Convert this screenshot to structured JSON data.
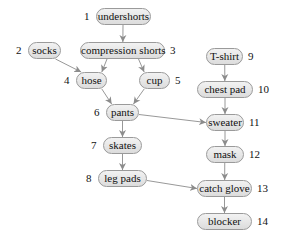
{
  "diagram": {
    "type": "dependency-graph",
    "title": "",
    "colors": {
      "node_fill": "#e6e6e6",
      "node_border": "#9a9a9a",
      "edge": "#8c8c8c",
      "text": "#111111"
    },
    "nodes": [
      {
        "id": 1,
        "num": "1",
        "label": "undershorts",
        "x": 96,
        "y": 8,
        "w": 55,
        "numSide": "left"
      },
      {
        "id": 2,
        "num": "2",
        "label": "socks",
        "x": 28,
        "y": 42,
        "w": 33,
        "numSide": "left"
      },
      {
        "id": 3,
        "num": "3",
        "label": "compression shorts",
        "x": 80,
        "y": 42,
        "w": 85,
        "numSide": "right"
      },
      {
        "id": 4,
        "num": "4",
        "label": "hose",
        "x": 76,
        "y": 72,
        "w": 31,
        "numSide": "left"
      },
      {
        "id": 5,
        "num": "5",
        "label": "cup",
        "x": 139,
        "y": 72,
        "w": 31,
        "numSide": "right"
      },
      {
        "id": 6,
        "num": "6",
        "label": "pants",
        "x": 106,
        "y": 104,
        "w": 33,
        "numSide": "left"
      },
      {
        "id": 7,
        "num": "7",
        "label": "skates",
        "x": 103,
        "y": 137,
        "w": 39,
        "numSide": "left"
      },
      {
        "id": 8,
        "num": "8",
        "label": "leg pads",
        "x": 98,
        "y": 170,
        "w": 49,
        "numSide": "left"
      },
      {
        "id": 9,
        "num": "9",
        "label": "T-shirt",
        "x": 206,
        "y": 48,
        "w": 37,
        "numSide": "right"
      },
      {
        "id": 10,
        "num": "10",
        "label": "chest pad",
        "x": 197,
        "y": 81,
        "w": 56,
        "numSide": "right"
      },
      {
        "id": 11,
        "num": "11",
        "label": "sweater",
        "x": 206,
        "y": 114,
        "w": 38,
        "numSide": "right"
      },
      {
        "id": 12,
        "num": "12",
        "label": "mask",
        "x": 206,
        "y": 146,
        "w": 38,
        "numSide": "right"
      },
      {
        "id": 13,
        "num": "13",
        "label": "catch glove",
        "x": 197,
        "y": 180,
        "w": 55,
        "numSide": "right"
      },
      {
        "id": 14,
        "num": "14",
        "label": "blocker",
        "x": 197,
        "y": 213,
        "w": 55,
        "numSide": "right"
      }
    ],
    "edges": [
      {
        "from": 1,
        "to": 3
      },
      {
        "from": 2,
        "to": 4
      },
      {
        "from": 3,
        "to": 4
      },
      {
        "from": 3,
        "to": 5
      },
      {
        "from": 4,
        "to": 6
      },
      {
        "from": 5,
        "to": 6
      },
      {
        "from": 6,
        "to": 7
      },
      {
        "from": 6,
        "to": 11
      },
      {
        "from": 7,
        "to": 8
      },
      {
        "from": 8,
        "to": 13
      },
      {
        "from": 9,
        "to": 10
      },
      {
        "from": 10,
        "to": 11
      },
      {
        "from": 11,
        "to": 12
      },
      {
        "from": 12,
        "to": 13
      },
      {
        "from": 13,
        "to": 14
      }
    ]
  }
}
